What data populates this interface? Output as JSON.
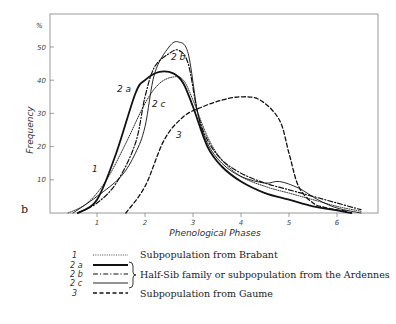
{
  "chart_data": {
    "type": "line",
    "title": "",
    "panel_label": "b",
    "xlabel": "Phenological Phases",
    "ylabel": "Frequency",
    "y_unit": "%",
    "xlim": [
      0,
      6.9
    ],
    "ylim": [
      0,
      56
    ],
    "x_ticks": [
      "1",
      "2",
      "3",
      "4",
      "5",
      "6"
    ],
    "y_ticks": [
      "10",
      "20",
      "30",
      "40",
      "50"
    ],
    "grid": false,
    "legend_position": "below",
    "series": [
      {
        "key": "1",
        "name": "Subpopulation from Brabant",
        "style": "dotted",
        "x": [
          0.4,
          0.8,
          1.2,
          1.6,
          2.0,
          2.3,
          2.6,
          2.8,
          3.0,
          3.3,
          3.6,
          4.0,
          4.5,
          5.0,
          5.5,
          6.0,
          6.5
        ],
        "y": [
          0,
          3,
          10,
          21,
          33,
          39,
          41,
          40,
          34,
          23,
          16,
          11,
          8,
          6,
          4,
          2,
          0.5
        ]
      },
      {
        "key": "2a",
        "name": "Half-Sib family or subpopulation from the Ardennes",
        "style": "solid-thick",
        "x": [
          0.6,
          1.0,
          1.4,
          1.8,
          2.0,
          2.3,
          2.6,
          2.8,
          3.0,
          3.3,
          3.6,
          4.0,
          4.5,
          5.0,
          5.5,
          6.0,
          6.3
        ],
        "y": [
          0,
          4,
          18,
          36,
          40,
          42.5,
          42,
          39,
          32,
          20,
          14,
          9.5,
          6,
          4,
          2,
          0.8,
          0
        ]
      },
      {
        "key": "2b",
        "name": "Half-Sib family or subpopulation from the Ardennes",
        "style": "dash-dot",
        "x": [
          0.6,
          1.0,
          1.4,
          1.8,
          2.0,
          2.2,
          2.5,
          2.7,
          2.9,
          3.1,
          3.3,
          3.6,
          4.0,
          4.5,
          5.0,
          5.5,
          6.0,
          6.5
        ],
        "y": [
          0,
          3,
          9,
          21,
          35,
          44,
          48,
          49,
          45,
          30,
          22,
          16,
          12,
          9,
          7,
          5,
          3,
          1
        ]
      },
      {
        "key": "2c",
        "name": "Half-Sib family or subpopulation from the Ardennes",
        "style": "solid-thin",
        "x": [
          0.5,
          1.0,
          1.5,
          1.8,
          2.0,
          2.2,
          2.5,
          2.7,
          2.9,
          3.1,
          3.3,
          3.6,
          4.0,
          4.5,
          4.8,
          5.2,
          5.6,
          6.0,
          6.5
        ],
        "y": [
          0,
          5,
          11,
          18,
          26,
          42,
          50,
          51.5,
          48,
          30,
          21,
          15,
          11,
          9,
          9.5,
          7.5,
          4,
          1.5,
          0
        ]
      },
      {
        "key": "3",
        "name": "Subpopulation from Gaume",
        "style": "dashed",
        "x": [
          1.6,
          2.0,
          2.4,
          2.8,
          3.2,
          3.6,
          4.0,
          4.4,
          4.8,
          5.0,
          5.2,
          5.5,
          5.8,
          6.2
        ],
        "y": [
          0,
          8,
          22,
          29,
          32,
          34,
          35,
          34,
          28,
          18,
          8,
          3,
          1.5,
          0.5
        ]
      }
    ]
  },
  "labels": {
    "y_unit": "%",
    "ylabel": "Frequency",
    "xlabel": "Phenological Phases",
    "panel": "b",
    "curve_1": "1",
    "curve_2a": "2 a",
    "curve_2b": "2 b",
    "curve_2c": "2 c",
    "curve_3": "3"
  },
  "legend": {
    "keys": [
      "1",
      "2 a",
      "2 b",
      "2 c",
      "3"
    ],
    "texts": {
      "brabant": "Subpopulation from Brabant",
      "ardennes": "Half-Sib family or subpopulation from the Ardennes",
      "gaume": "Subpopulation from Gaume"
    }
  }
}
